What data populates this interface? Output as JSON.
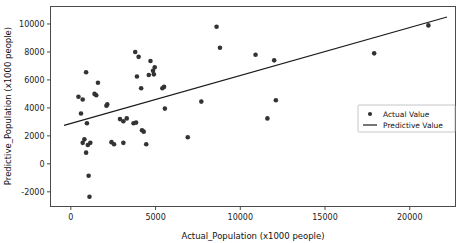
{
  "chart_data": {
    "type": "scatter",
    "title": "",
    "xlabel": "Actual_Population (x1000 people)",
    "ylabel": "Predictive_Population (x1000 people)",
    "xlim": [
      -1200,
      22700
    ],
    "ylim": [
      -3050,
      11250
    ],
    "grid": false,
    "legend_position": "center right",
    "x_ticks": [
      0,
      5000,
      10000,
      15000,
      20000
    ],
    "x_tick_labels": [
      "0",
      "5000",
      "10000",
      "15000",
      "20000"
    ],
    "y_ticks": [
      -2000,
      0,
      2000,
      4000,
      6000,
      8000,
      10000
    ],
    "y_tick_labels": [
      "-2000",
      "0",
      "2000",
      "4000",
      "6000",
      "8000",
      "10000"
    ],
    "series": [
      {
        "name": "Actual Value",
        "type": "scatter",
        "marker": "circle",
        "color": "#333333",
        "points": [
          [
            450,
            4800
          ],
          [
            700,
            4600
          ],
          [
            600,
            3600
          ],
          [
            900,
            6550
          ],
          [
            950,
            2900
          ],
          [
            800,
            1750
          ],
          [
            700,
            1500
          ],
          [
            1000,
            1350
          ],
          [
            1150,
            1500
          ],
          [
            900,
            800
          ],
          [
            1050,
            -850
          ],
          [
            1100,
            -2350
          ],
          [
            1400,
            5000
          ],
          [
            1500,
            4900
          ],
          [
            1600,
            5800
          ],
          [
            2100,
            4150
          ],
          [
            2150,
            4250
          ],
          [
            2400,
            1550
          ],
          [
            2550,
            1400
          ],
          [
            3100,
            1500
          ],
          [
            2900,
            3200
          ],
          [
            3100,
            3050
          ],
          [
            3300,
            3250
          ],
          [
            3800,
            8000
          ],
          [
            4000,
            7650
          ],
          [
            4150,
            5400
          ],
          [
            3900,
            6250
          ],
          [
            3700,
            2900
          ],
          [
            3850,
            2950
          ],
          [
            4200,
            2400
          ],
          [
            4300,
            2300
          ],
          [
            4700,
            7350
          ],
          [
            4850,
            6650
          ],
          [
            4900,
            6400
          ],
          [
            4950,
            6900
          ],
          [
            4600,
            6350
          ],
          [
            4450,
            1400
          ],
          [
            5400,
            5400
          ],
          [
            5500,
            5500
          ],
          [
            5550,
            3950
          ],
          [
            6900,
            1900
          ],
          [
            7700,
            4450
          ],
          [
            8600,
            9800
          ],
          [
            8800,
            8300
          ],
          [
            10900,
            7800
          ],
          [
            11600,
            3250
          ],
          [
            12000,
            7400
          ],
          [
            12100,
            4550
          ],
          [
            17900,
            7900
          ],
          [
            21100,
            9900
          ]
        ]
      },
      {
        "name": "Predictive Value",
        "type": "line",
        "color": "#1a1a1a",
        "points": [
          [
            -400,
            2750
          ],
          [
            22200,
            10500
          ]
        ]
      }
    ]
  },
  "legend": {
    "entries": [
      {
        "label": "Actual Value",
        "marker": "dot"
      },
      {
        "label": "Predictive Value",
        "marker": "line"
      }
    ]
  }
}
